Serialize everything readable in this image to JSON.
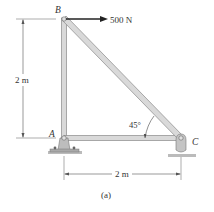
{
  "figure": {
    "caption": "(a)",
    "joints": {
      "A": "A",
      "B": "B",
      "C": "C"
    },
    "load": {
      "label": "500 N",
      "at": "B",
      "direction": "right"
    },
    "dimensions": {
      "vertical": "2 m",
      "horizontal": "2 m"
    },
    "angle": "45°",
    "colors": {
      "member_fill": "#d9d9d9",
      "member_stroke": "#8a8a8a",
      "support": "#bdbdbd",
      "line": "#555555"
    }
  }
}
